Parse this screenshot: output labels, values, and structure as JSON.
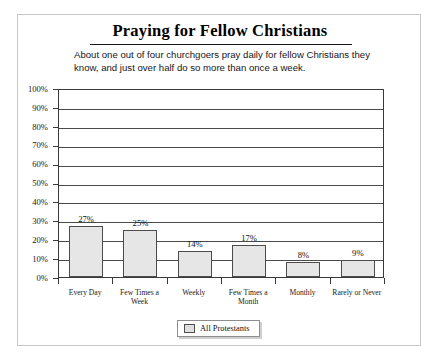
{
  "figure": {
    "title": "Praying for Fellow Christians",
    "subtitle": "About one out of four churchgoers pray daily for fellow Christians they know, and just over half do so more than once a week."
  },
  "legend": {
    "entries": [
      {
        "label": "All Protestants",
        "color": "#e6e6e6"
      }
    ]
  },
  "chart_data": {
    "type": "bar",
    "title": "Praying for Fellow Christians",
    "subtitle": "About one out of four churchgoers pray daily for fellow Christians they know, and just over half do so more than once a week.",
    "categories": [
      "Every Day",
      "Few Times a Week",
      "Weekly",
      "Few Times a Month",
      "Monthly",
      "Rarely or Never"
    ],
    "category_lines": [
      [
        "Every Day"
      ],
      [
        "Few Times a",
        "Week"
      ],
      [
        "Weekly"
      ],
      [
        "Few Times a",
        "Month"
      ],
      [
        "Monthly"
      ],
      [
        "Rarely or Never"
      ]
    ],
    "series": [
      {
        "name": "All Protestants",
        "values": [
          27,
          25,
          14,
          17,
          8,
          9
        ],
        "value_labels": [
          "27%",
          "25%",
          "14%",
          "17%",
          "8%",
          "9%"
        ],
        "color": "#e6e6e6",
        "border_color": "#4c4c4c"
      }
    ],
    "xlabel": "",
    "ylabel": "",
    "ylim": [
      0,
      100
    ],
    "ytick_values": [
      0,
      10,
      20,
      30,
      40,
      50,
      60,
      70,
      80,
      90,
      100
    ],
    "ytick_labels": [
      "0%",
      "10%",
      "20%",
      "30%",
      "40%",
      "50%",
      "60%",
      "70%",
      "80%",
      "90%",
      "100%"
    ],
    "grid": "horizontal",
    "legend_position": "bottom-center"
  }
}
